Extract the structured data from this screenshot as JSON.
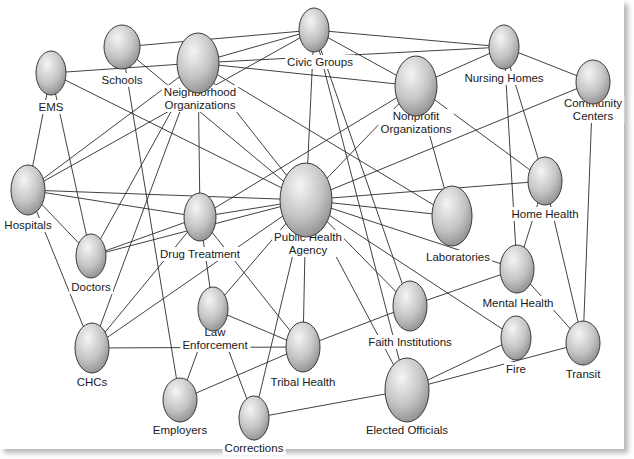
{
  "diagram": {
    "title": "",
    "type": "network",
    "colors": {
      "node_light": "#f4f4f4",
      "node_dark": "#8c8c8c",
      "node_stroke": "#3a3a3a",
      "edge": "#2b2b2b",
      "background": "#ffffff"
    },
    "nodes": [
      {
        "id": "civic",
        "label": [
          "Civic Groups"
        ],
        "cx": 314,
        "cy": 30,
        "rx": 15,
        "ry": 22,
        "lx": 320,
        "ly": 66,
        "anchor": "middle"
      },
      {
        "id": "schools",
        "label": [
          "Schools"
        ],
        "cx": 122,
        "cy": 47,
        "rx": 18,
        "ry": 22,
        "lx": 122,
        "ly": 84,
        "anchor": "middle"
      },
      {
        "id": "neighborhood",
        "label": [
          "Neighborhood",
          "Organizations"
        ],
        "cx": 198,
        "cy": 63,
        "rx": 21,
        "ry": 30,
        "lx": 200,
        "ly": 109,
        "anchor": "middle"
      },
      {
        "id": "ems",
        "label": [
          "EMS"
        ],
        "cx": 51,
        "cy": 73,
        "rx": 15,
        "ry": 22,
        "lx": 51,
        "ly": 111,
        "anchor": "middle"
      },
      {
        "id": "nursing",
        "label": [
          "Nursing Homes"
        ],
        "cx": 504,
        "cy": 47,
        "rx": 15,
        "ry": 22,
        "lx": 504,
        "ly": 82,
        "anchor": "middle"
      },
      {
        "id": "nonprofit",
        "label": [
          "Nonprofit",
          "Organizations"
        ],
        "cx": 416,
        "cy": 86,
        "rx": 21,
        "ry": 30,
        "lx": 416,
        "ly": 133,
        "anchor": "middle"
      },
      {
        "id": "community",
        "label": [
          "Community",
          "Centers"
        ],
        "cx": 593,
        "cy": 82,
        "rx": 17,
        "ry": 22,
        "lx": 593,
        "ly": 120,
        "anchor": "middle"
      },
      {
        "id": "hospitals",
        "label": [
          "Hospitals"
        ],
        "cx": 28,
        "cy": 190,
        "rx": 17,
        "ry": 25,
        "lx": 28,
        "ly": 229,
        "anchor": "middle"
      },
      {
        "id": "pha",
        "label": [
          "Public Health",
          "Agency"
        ],
        "cx": 306,
        "cy": 200,
        "rx": 26,
        "ry": 37,
        "lx": 308,
        "ly": 254,
        "anchor": "middle"
      },
      {
        "id": "drug",
        "label": [
          "Drug Treatment"
        ],
        "cx": 200,
        "cy": 217,
        "rx": 16,
        "ry": 24,
        "lx": 200,
        "ly": 258,
        "anchor": "middle"
      },
      {
        "id": "labs",
        "label": [
          "Laboratories"
        ],
        "cx": 452,
        "cy": 216,
        "rx": 20,
        "ry": 30,
        "lx": 458,
        "ly": 261,
        "anchor": "middle"
      },
      {
        "id": "homehealth",
        "label": [
          "Home Health"
        ],
        "cx": 545,
        "cy": 181,
        "rx": 17,
        "ry": 24,
        "lx": 545,
        "ly": 218,
        "anchor": "middle"
      },
      {
        "id": "doctors",
        "label": [
          "Doctors"
        ],
        "cx": 91,
        "cy": 256,
        "rx": 15,
        "ry": 22,
        "lx": 91,
        "ly": 291,
        "anchor": "middle"
      },
      {
        "id": "mental",
        "label": [
          "Mental Health"
        ],
        "cx": 517,
        "cy": 269,
        "rx": 17,
        "ry": 24,
        "lx": 518,
        "ly": 307,
        "anchor": "middle"
      },
      {
        "id": "law",
        "label": [
          "Law",
          "Enforcement"
        ],
        "cx": 213,
        "cy": 309,
        "rx": 15,
        "ry": 22,
        "lx": 215,
        "ly": 349,
        "anchor": "middle"
      },
      {
        "id": "faith",
        "label": [
          "Faith Institutions"
        ],
        "cx": 410,
        "cy": 306,
        "rx": 17,
        "ry": 25,
        "lx": 410,
        "ly": 346,
        "anchor": "middle"
      },
      {
        "id": "chcs",
        "label": [
          "CHCs"
        ],
        "cx": 92,
        "cy": 348,
        "rx": 17,
        "ry": 25,
        "lx": 92,
        "ly": 386,
        "anchor": "middle"
      },
      {
        "id": "tribal",
        "label": [
          "Tribal Health"
        ],
        "cx": 303,
        "cy": 347,
        "rx": 17,
        "ry": 25,
        "lx": 303,
        "ly": 386,
        "anchor": "middle"
      },
      {
        "id": "fire",
        "label": [
          "Fire"
        ],
        "cx": 516,
        "cy": 338,
        "rx": 15,
        "ry": 22,
        "lx": 516,
        "ly": 373,
        "anchor": "middle"
      },
      {
        "id": "transit",
        "label": [
          "Transit"
        ],
        "cx": 583,
        "cy": 343,
        "rx": 17,
        "ry": 22,
        "lx": 583,
        "ly": 378,
        "anchor": "middle"
      },
      {
        "id": "employers",
        "label": [
          "Employers"
        ],
        "cx": 180,
        "cy": 400,
        "rx": 17,
        "ry": 22,
        "lx": 180,
        "ly": 434,
        "anchor": "middle"
      },
      {
        "id": "corrections",
        "label": [
          "Corrections"
        ],
        "cx": 254,
        "cy": 418,
        "rx": 15,
        "ry": 22,
        "lx": 254,
        "ly": 452,
        "anchor": "middle"
      },
      {
        "id": "elected",
        "label": [
          "Elected Officials"
        ],
        "cx": 407,
        "cy": 390,
        "rx": 22,
        "ry": 32,
        "lx": 407,
        "ly": 434,
        "anchor": "middle"
      }
    ],
    "edges": [
      [
        "schools",
        "civic"
      ],
      [
        "ems",
        "neighborhood"
      ],
      [
        "ems",
        "pha"
      ],
      [
        "ems",
        "hospitals"
      ],
      [
        "ems",
        "doctors"
      ],
      [
        "schools",
        "pha"
      ],
      [
        "schools",
        "employers"
      ],
      [
        "neighborhood",
        "civic"
      ],
      [
        "neighborhood",
        "nonprofit"
      ],
      [
        "neighborhood",
        "pha"
      ],
      [
        "neighborhood",
        "drug"
      ],
      [
        "neighborhood",
        "hospitals"
      ],
      [
        "neighborhood",
        "doctors"
      ],
      [
        "neighborhood",
        "chcs"
      ],
      [
        "neighborhood",
        "labs"
      ],
      [
        "civic",
        "nursing"
      ],
      [
        "civic",
        "nonprofit"
      ],
      [
        "civic",
        "pha"
      ],
      [
        "civic",
        "faith"
      ],
      [
        "civic",
        "elected"
      ],
      [
        "civic",
        "hospitals"
      ],
      [
        "nursing",
        "neighborhood"
      ],
      [
        "nursing",
        "community"
      ],
      [
        "nursing",
        "nonprofit"
      ],
      [
        "nursing",
        "homehealth"
      ],
      [
        "nursing",
        "mental"
      ],
      [
        "nonprofit",
        "pha"
      ],
      [
        "nonprofit",
        "homehealth"
      ],
      [
        "nonprofit",
        "labs"
      ],
      [
        "nonprofit",
        "drug"
      ],
      [
        "community",
        "pha"
      ],
      [
        "community",
        "transit"
      ],
      [
        "hospitals",
        "pha"
      ],
      [
        "hospitals",
        "drug"
      ],
      [
        "hospitals",
        "doctors"
      ],
      [
        "hospitals",
        "chcs"
      ],
      [
        "pha",
        "drug"
      ],
      [
        "pha",
        "homehealth"
      ],
      [
        "pha",
        "labs"
      ],
      [
        "pha",
        "mental"
      ],
      [
        "pha",
        "faith"
      ],
      [
        "pha",
        "fire"
      ],
      [
        "pha",
        "tribal"
      ],
      [
        "pha",
        "law"
      ],
      [
        "pha",
        "corrections"
      ],
      [
        "pha",
        "chcs"
      ],
      [
        "pha",
        "elected"
      ],
      [
        "pha",
        "doctors"
      ],
      [
        "drug",
        "doctors"
      ],
      [
        "drug",
        "chcs"
      ],
      [
        "drug",
        "law"
      ],
      [
        "drug",
        "tribal"
      ],
      [
        "homehealth",
        "mental"
      ],
      [
        "homehealth",
        "transit"
      ],
      [
        "mental",
        "faith"
      ],
      [
        "mental",
        "transit"
      ],
      [
        "law",
        "employers"
      ],
      [
        "law",
        "corrections"
      ],
      [
        "chcs",
        "tribal"
      ],
      [
        "tribal",
        "employers"
      ],
      [
        "tribal",
        "faith"
      ],
      [
        "fire",
        "elected"
      ],
      [
        "transit",
        "elected"
      ],
      [
        "corrections",
        "elected"
      ],
      [
        "tribal",
        "law"
      ]
    ]
  }
}
